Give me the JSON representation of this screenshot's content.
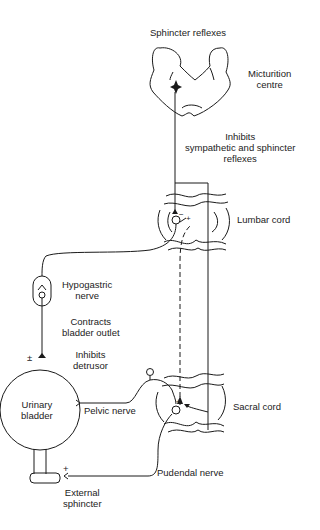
{
  "labels": {
    "sphincter_reflexes": "Sphincter reflexes",
    "micturition_centre": [
      "Micturition",
      "centre"
    ],
    "inhibits_sympathetic": [
      "Inhibits",
      "sympathetic and sphincter",
      "reflexes"
    ],
    "lumbar_cord": "Lumbar cord",
    "hypogastric_nerve": [
      "Hypogastric",
      "nerve"
    ],
    "contracts_bladder_outlet": [
      "Contracts",
      "bladder outlet"
    ],
    "inhibits_detrusor": [
      "Inhibits",
      "detrusor"
    ],
    "plus_minus": "±",
    "urinary_bladder": [
      "Urinary",
      "bladder"
    ],
    "pelvic_nerve": "Pelvic nerve",
    "sacral_cord": "Sacral cord",
    "pudendal_nerve": "Pudendal nerve",
    "external_sphincter": [
      "External",
      "sphincter"
    ],
    "plus_sign": "+",
    "minus_sign": "−"
  },
  "colors": {
    "line": "#1a1a1a",
    "background": "#ffffff"
  }
}
